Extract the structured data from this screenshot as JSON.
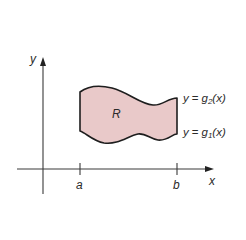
{
  "diagram": {
    "type": "region-between-curves",
    "axes": {
      "x_label": "x",
      "y_label": "y"
    },
    "ticks": {
      "a_label": "a",
      "b_label": "b"
    },
    "region": {
      "label": "R",
      "fill_color": "#e9c9c9",
      "stroke_color": "#1e1e1e"
    },
    "curves": {
      "upper": {
        "prefix": "y",
        "equals": "=",
        "func": "g",
        "subscript": "2",
        "arg": "(x)"
      },
      "lower": {
        "prefix": "y",
        "equals": "=",
        "func": "g",
        "subscript": "1",
        "arg": "(x)"
      }
    },
    "axis_color": "#3a3a3a"
  }
}
